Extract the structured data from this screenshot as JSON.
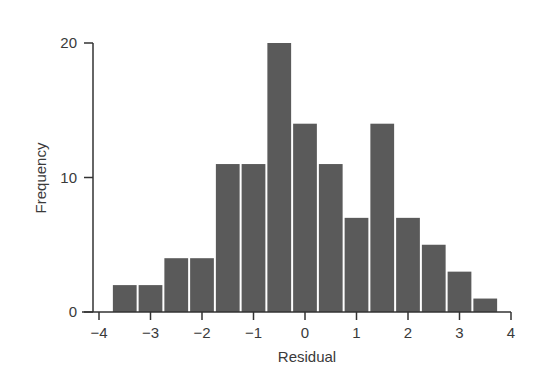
{
  "chart_data": {
    "type": "bar",
    "subtype": "histogram",
    "title": "",
    "xlabel": "Residual",
    "ylabel": "Frequency",
    "bin_width": 0.5,
    "bin_start": -3.75,
    "categories": [
      "-3.5",
      "-3.0",
      "-2.5",
      "-2.0",
      "-1.5",
      "-1.0",
      "-0.5",
      "0.0",
      "0.5",
      "1.0",
      "1.5",
      "2.0",
      "2.5",
      "3.0",
      "3.5"
    ],
    "values": [
      2,
      2,
      4,
      4,
      11,
      11,
      20,
      14,
      11,
      7,
      14,
      7,
      5,
      3,
      1
    ],
    "xlim": [
      -4,
      4
    ],
    "ylim": [
      0,
      20
    ],
    "xticks": [
      -4,
      -3,
      -2,
      -1,
      0,
      1,
      2,
      3,
      4
    ],
    "xtick_labels": [
      "−4",
      "−3",
      "−2",
      "−1",
      "0",
      "1",
      "2",
      "3",
      "4"
    ],
    "yticks": [
      0,
      10,
      20
    ],
    "ytick_labels": [
      "0",
      "10",
      "20"
    ],
    "grid": false,
    "legend": null,
    "colors": {
      "bar": "#5a5a5a",
      "axis": "#333333",
      "text": "#3a3a3a",
      "background": "#ffffff"
    }
  }
}
